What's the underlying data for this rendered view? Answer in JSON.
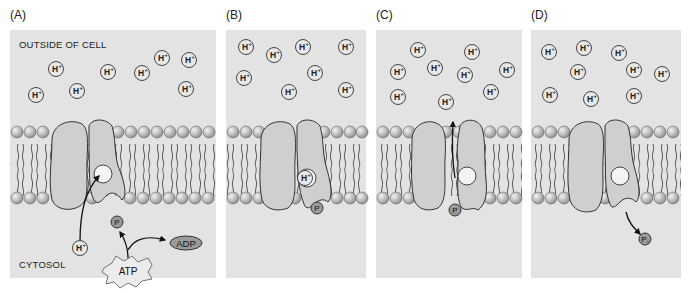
{
  "figure": {
    "panels": [
      {
        "id": "A",
        "label": "(A)"
      },
      {
        "id": "B",
        "label": "(B)"
      },
      {
        "id": "C",
        "label": "(C)"
      },
      {
        "id": "D",
        "label": "(D)"
      }
    ],
    "region_labels": {
      "outside": "OUTSIDE OF CELL",
      "inside": "CYTOSOL"
    },
    "molecules": {
      "proton": "H+",
      "phosphate": "P",
      "inorganic_phosphate": "Pi",
      "atp": "ATP",
      "adp": "ADP"
    },
    "colors": {
      "panel_bg": "#e3e3e3",
      "protein": "#cfcfcf",
      "lipid_head": "#b5b5b5",
      "outline": "#333333"
    }
  }
}
